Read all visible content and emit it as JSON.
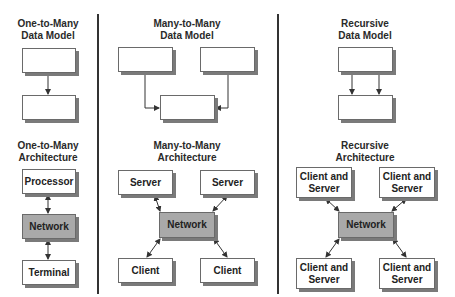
{
  "columns": [
    {
      "data_model_title": "One-to-Many\nData Model",
      "data_model_title_lines": [
        "One-to-Many",
        "Data Model"
      ],
      "architecture_title_lines": [
        "One-to-Many",
        "Architecture"
      ],
      "architecture_nodes": [
        "Processor",
        "Network",
        "Terminal"
      ]
    },
    {
      "data_model_title_lines": [
        "Many-to-Many",
        "Data Model"
      ],
      "architecture_title_lines": [
        "Many-to-Many",
        "Architecture"
      ],
      "architecture_nodes": [
        "Server",
        "Server",
        "Network",
        "Client",
        "Client"
      ]
    },
    {
      "data_model_title_lines": [
        "Recursive",
        "Data Model"
      ],
      "architecture_title_lines": [
        "Recursive",
        "Architecture"
      ],
      "architecture_nodes": [
        "Client and Server",
        "Client and Server",
        "Network",
        "Client and Server",
        "Client and Server"
      ]
    }
  ],
  "colors": {
    "network_fill": "#a9a9a9",
    "box_fill": "#ffffff",
    "shadow": "#7a7a7a",
    "line": "#333333"
  }
}
